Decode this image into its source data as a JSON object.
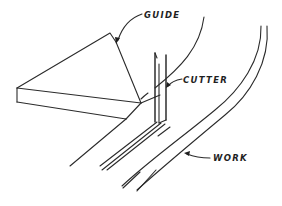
{
  "diagram": {
    "type": "technical-line-drawing",
    "stroke_color": "#2b2b2b",
    "background_color": "#ffffff",
    "labels": {
      "guide": "GUIDE",
      "cutter": "CUTTER",
      "work": "WORK"
    },
    "components": [
      {
        "name": "guide",
        "description": "Triangular slab guide block"
      },
      {
        "name": "cutter",
        "description": "Vertical blade cutter"
      },
      {
        "name": "work",
        "description": "Curved work piece strip"
      }
    ]
  }
}
